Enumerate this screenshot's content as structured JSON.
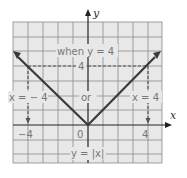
{
  "diagram": {
    "function_label": "y = |x|",
    "annotation_top": "when y = 4",
    "left_label": "x = − 4",
    "middle_label": "or",
    "right_label": "x = 4",
    "axis_x_label": "x",
    "axis_y_label": "y",
    "tick_labels": {
      "x_neg": "−4",
      "origin": "0",
      "x_pos": "4",
      "y_pos": "4"
    },
    "colors": {
      "grid_bg": "#e8e8e8",
      "grid_line": "#8a8a8a",
      "curve": "#3a3a3a",
      "dashed": "#555555"
    }
  }
}
